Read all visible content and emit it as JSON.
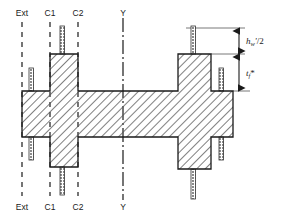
{
  "figure": {
    "background_color": "#ffffff",
    "line_color": "#1a1a1a",
    "hatch_color": "#555555"
  },
  "axes": {
    "top_labels": [
      {
        "id": "ext-top",
        "text": "Ext",
        "x": 22
      },
      {
        "id": "c1-top",
        "text": "C1",
        "x": 50
      },
      {
        "id": "c2-top",
        "text": "C2",
        "x": 78
      },
      {
        "id": "y-top",
        "text": "Y",
        "x": 123
      }
    ],
    "bottom_labels": [
      {
        "id": "ext-bottom",
        "text": "Ext",
        "x": 22
      },
      {
        "id": "c1-bottom",
        "text": "C1",
        "x": 50
      },
      {
        "id": "c2-bottom",
        "text": "C2",
        "x": 78
      },
      {
        "id": "y-bottom",
        "text": "Y",
        "x": 123
      }
    ]
  },
  "dimensions": {
    "upper": {
      "symbol": "h",
      "subscript": "w",
      "prime": "'",
      "divisor": "/2",
      "full_text": "hw'/2",
      "from_y": 28,
      "to_y": 54
    },
    "lower": {
      "symbol": "t",
      "subscript": "f",
      "star": "*",
      "full_text": "tf*",
      "from_y": 54,
      "to_y": 91
    },
    "line_x": 239
  },
  "geometry": {
    "flange": {
      "x": 22,
      "y": 91,
      "width": 211,
      "height": 46
    },
    "left_web": {
      "x": 50,
      "y": 54,
      "width": 28,
      "height": 113
    },
    "right_web": {
      "x": 178,
      "y": 54,
      "width": 33,
      "height": 115
    },
    "stiffeners": [
      {
        "id": "left-outer-upper",
        "x": 29,
        "y": 68,
        "width": 4,
        "height": 23
      },
      {
        "id": "left-outer-lower",
        "x": 29,
        "y": 137,
        "width": 4,
        "height": 23
      },
      {
        "id": "left-web-upper",
        "x": 60,
        "y": 26,
        "width": 4,
        "height": 28
      },
      {
        "id": "left-web-lower",
        "x": 60,
        "y": 167,
        "width": 4,
        "height": 28
      },
      {
        "id": "right-web-upper",
        "x": 191,
        "y": 26,
        "width": 4,
        "height": 28
      },
      {
        "id": "right-web-lower",
        "x": 191,
        "y": 169,
        "width": 4,
        "height": 30
      },
      {
        "id": "right-outer-upper",
        "x": 219,
        "y": 68,
        "width": 4,
        "height": 23
      },
      {
        "id": "right-outer-lower",
        "x": 219,
        "y": 137,
        "width": 4,
        "height": 23
      }
    ]
  }
}
